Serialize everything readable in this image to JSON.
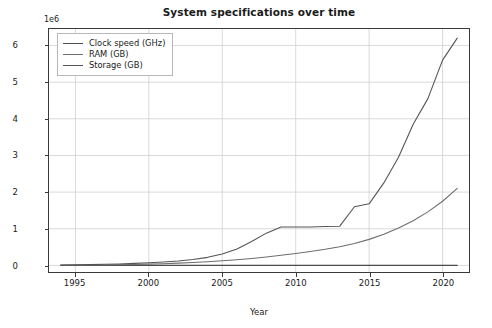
{
  "chart_data": {
    "type": "line",
    "title": "System specifications over time",
    "xlabel": "Year",
    "ylabel": "Values",
    "y_offset_text": "1e6",
    "y_offset_multiplier": 1000000,
    "xlim": [
      1993.2,
      2021.8
    ],
    "ylim": [
      -0.18,
      6.45
    ],
    "xticks": [
      1995,
      2000,
      2005,
      2010,
      2015,
      2020
    ],
    "xtick_labels": [
      "1995",
      "2000",
      "2005",
      "2010",
      "2015",
      "2020"
    ],
    "yticks": [
      0,
      1,
      2,
      3,
      4,
      5,
      6
    ],
    "ytick_labels": [
      "0",
      "1",
      "2",
      "3",
      "4",
      "5",
      "6"
    ],
    "grid": true,
    "legend_position": "upper left",
    "background": "#ffffff",
    "x": [
      1994,
      1995,
      1996,
      1997,
      1998,
      1999,
      2000,
      2001,
      2002,
      2003,
      2004,
      2005,
      2006,
      2007,
      2008,
      2009,
      2010,
      2011,
      2012,
      2013,
      2014,
      2015,
      2016,
      2017,
      2018,
      2019,
      2020,
      2021
    ],
    "series": [
      {
        "name": "Clock speed (GHz)",
        "color": "#4d4d4d",
        "values": [
          7e-08,
          1e-07,
          1.5e-07,
          2e-07,
          3e-07,
          5e-07,
          8e-07,
          1.2e-06,
          1.8e-06,
          2.2e-06,
          2.6e-06,
          2.8e-06,
          2.9e-06,
          3e-06,
          3.1e-06,
          3.2e-06,
          3.3e-06,
          3.4e-06,
          3.5e-06,
          3.6e-06,
          3.7e-06,
          3.8e-06,
          3.9e-06,
          4e-06,
          4.2e-06,
          4.4e-06,
          4.7e-06,
          5e-06
        ]
      },
      {
        "name": "RAM (GB)",
        "color": "#6e6e6e",
        "values": [
          0.004,
          0.006,
          0.009,
          0.013,
          0.018,
          0.025,
          0.034,
          0.046,
          0.061,
          0.079,
          0.1,
          0.125,
          0.155,
          0.19,
          0.23,
          0.275,
          0.325,
          0.38,
          0.44,
          0.51,
          0.6,
          0.71,
          0.85,
          1.02,
          1.22,
          1.46,
          1.75,
          2.1
        ]
      },
      {
        "name": "Storage (GB)",
        "color": "#555555",
        "values": [
          0.01,
          0.015,
          0.022,
          0.03,
          0.04,
          0.055,
          0.072,
          0.095,
          0.12,
          0.16,
          0.22,
          0.31,
          0.45,
          0.65,
          0.88,
          1.05,
          1.05,
          1.05,
          1.06,
          1.07,
          1.6,
          1.68,
          2.25,
          2.95,
          3.85,
          4.55,
          5.6,
          6.2
        ]
      }
    ]
  }
}
